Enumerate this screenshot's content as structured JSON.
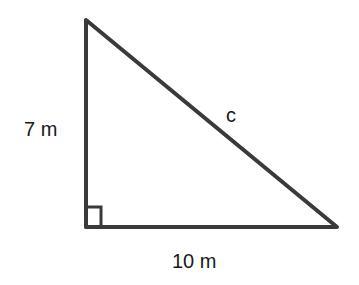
{
  "diagram": {
    "type": "right-triangle",
    "labels": {
      "vertical_side": "7 m",
      "horizontal_side": "10 m",
      "hypotenuse": "c"
    },
    "right_angle_marker": true,
    "stroke_color": "#3a3a3a"
  }
}
